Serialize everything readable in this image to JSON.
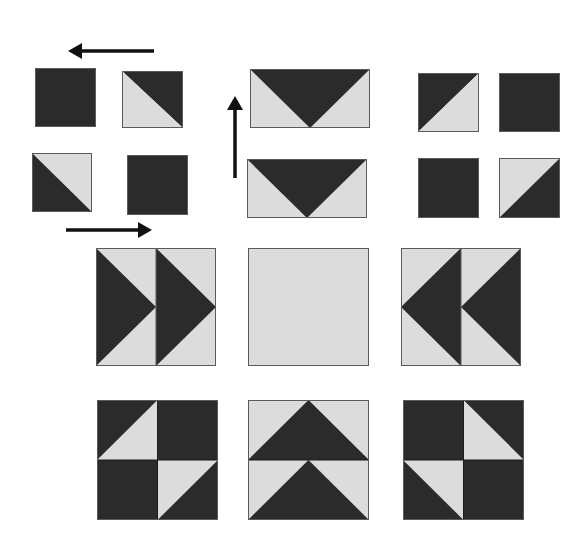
{
  "colors": {
    "background": "#ffffff",
    "dark": "#2b2b2b",
    "light": "#dcdcdc",
    "outline": "#5a5a5a",
    "arrow": "#111111"
  },
  "arrows": [
    {
      "id": "arrow-left",
      "direction": "left",
      "x1": 154,
      "y1": 51,
      "x2": 68,
      "y2": 51
    },
    {
      "id": "arrow-right",
      "direction": "right",
      "x1": 66,
      "y1": 230,
      "x2": 152,
      "y2": 230
    },
    {
      "id": "arrow-up",
      "direction": "up",
      "x1": 235,
      "y1": 178,
      "x2": 235,
      "y2": 96
    }
  ],
  "units": [
    {
      "name": "hst-group-left-square-1",
      "x": 35,
      "y": 68,
      "w": 61,
      "h": 59,
      "pattern": "solid-dark"
    },
    {
      "name": "hst-group-left-square-2",
      "x": 122,
      "y": 71,
      "w": 61,
      "h": 57,
      "pattern": "diag-tl-br-dark-top-right"
    },
    {
      "name": "hst-group-left-square-3",
      "x": 32,
      "y": 153,
      "w": 60,
      "h": 59,
      "pattern": "diag-tl-br-dark-bottom-left"
    },
    {
      "name": "hst-group-left-square-4",
      "x": 127,
      "y": 155,
      "w": 61,
      "h": 60,
      "pattern": "solid-dark"
    },
    {
      "name": "flying-geese-top",
      "x": 250,
      "y": 69,
      "w": 120,
      "h": 59,
      "pattern": "goose-down"
    },
    {
      "name": "flying-geese-bottom",
      "x": 247,
      "y": 159,
      "w": 120,
      "h": 59,
      "pattern": "goose-down"
    },
    {
      "name": "hst-group-right-square-1",
      "x": 418,
      "y": 73,
      "w": 61,
      "h": 59,
      "pattern": "diag-bl-tr-dark-top-left"
    },
    {
      "name": "hst-group-right-square-2",
      "x": 499,
      "y": 73,
      "w": 61,
      "h": 59,
      "pattern": "solid-dark"
    },
    {
      "name": "hst-group-right-square-3",
      "x": 418,
      "y": 158,
      "w": 61,
      "h": 60,
      "pattern": "solid-dark"
    },
    {
      "name": "hst-group-right-square-4",
      "x": 499,
      "y": 158,
      "w": 61,
      "h": 60,
      "pattern": "diag-bl-tr-dark-bottom-right"
    }
  ],
  "blocks": [
    {
      "name": "block-geese-right",
      "x": 96,
      "y": 248,
      "w": 120,
      "h": 118,
      "pattern": "double-geese-right"
    },
    {
      "name": "block-plain-center",
      "x": 248,
      "y": 248,
      "w": 121,
      "h": 118,
      "pattern": "solid-light"
    },
    {
      "name": "block-geese-left",
      "x": 401,
      "y": 248,
      "w": 120,
      "h": 118,
      "pattern": "double-geese-left"
    },
    {
      "name": "block-hst-left",
      "x": 97,
      "y": 400,
      "w": 121,
      "h": 120,
      "pattern": "four-patch-hst-left"
    },
    {
      "name": "block-geese-up",
      "x": 248,
      "y": 400,
      "w": 121,
      "h": 120,
      "pattern": "double-geese-up"
    },
    {
      "name": "block-hst-right",
      "x": 403,
      "y": 400,
      "w": 121,
      "h": 120,
      "pattern": "four-patch-hst-right"
    }
  ]
}
